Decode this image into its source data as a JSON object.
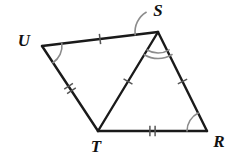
{
  "figure": {
    "background_color": "#ffffff",
    "stroke_color": "#1a1a1a",
    "tick_color": "#555555",
    "arc_color": "#8c8c8c"
  },
  "vertices": [
    {
      "name": "U",
      "label": "U",
      "x": 42,
      "y": 46,
      "label_x": 24,
      "label_y": 42
    },
    {
      "name": "S",
      "label": "S",
      "x": 158,
      "y": 32,
      "label_x": 158,
      "label_y": 12
    },
    {
      "name": "T",
      "label": "T",
      "x": 98,
      "y": 131,
      "label_x": 96,
      "label_y": 148
    },
    {
      "name": "R",
      "label": "R",
      "x": 207,
      "y": 131,
      "label_x": 219,
      "label_y": 143
    }
  ],
  "segments": [
    {
      "name": "segment-US",
      "from": "U",
      "to": "S",
      "x1": 42,
      "y1": 46,
      "x2": 158,
      "y2": 32,
      "ticks": 1
    },
    {
      "name": "segment-UT",
      "from": "U",
      "to": "T",
      "x1": 42,
      "y1": 46,
      "x2": 98,
      "y2": 131,
      "ticks": 2
    },
    {
      "name": "segment-ST",
      "from": "S",
      "to": "T",
      "x1": 158,
      "y1": 32,
      "x2": 98,
      "y2": 131,
      "ticks": 1
    },
    {
      "name": "segment-SR",
      "from": "S",
      "to": "R",
      "x1": 158,
      "y1": 32,
      "x2": 207,
      "y2": 131,
      "ticks": 1
    },
    {
      "name": "segment-TR",
      "from": "T",
      "to": "R",
      "x1": 98,
      "y1": 131,
      "x2": 207,
      "y2": 131,
      "ticks": 2
    }
  ],
  "angle_marks": [
    {
      "name": "angle-U",
      "vertex": "U",
      "arcs": 1,
      "radius": 20,
      "start_deg": -7,
      "end_deg": 57
    },
    {
      "name": "angle-UST",
      "vertex": "S",
      "arcs": 1,
      "radius": 23,
      "start_deg": 173,
      "end_deg": 239
    },
    {
      "name": "angle-TSR",
      "vertex": "S",
      "arcs": 2,
      "radius": 21,
      "start_deg": 58,
      "end_deg": 121
    },
    {
      "name": "angle-R",
      "vertex": "R",
      "arcs": 1,
      "radius": 20,
      "start_deg": 180,
      "end_deg": 244
    }
  ],
  "congruence": {
    "single_tick_segments": [
      "US",
      "ST",
      "SR"
    ],
    "double_tick_segments": [
      "UT",
      "TR"
    ],
    "single_arc_angles": [
      "U",
      "UST",
      "R"
    ],
    "double_arc_angles": [
      "TSR"
    ]
  }
}
